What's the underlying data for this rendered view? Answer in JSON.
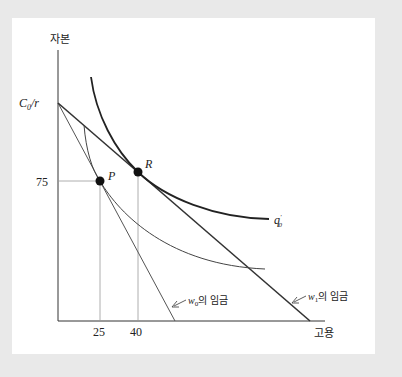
{
  "diagram": {
    "y_axis_label": "자본",
    "x_axis_label": "고용",
    "y_intercept_label": "C",
    "y_intercept_sub": "0",
    "y_intercept_suffix": "/r",
    "y_tick": "75",
    "x_ticks": [
      "25",
      "40"
    ],
    "point_p": "P",
    "point_r": "R",
    "isoquant_label": "q",
    "isoquant_sub": "0",
    "isoquant_prime": "'",
    "w0_label_var": "w",
    "w0_label_sub": "0",
    "w0_label_text": "의 임금",
    "w1_label_var": "w",
    "w1_label_sub": "1",
    "w1_label_text": "의 임금"
  },
  "colors": {
    "background": "#e9e9e9",
    "panel": "#ffffff",
    "line": "#333333",
    "guide": "#999999"
  }
}
